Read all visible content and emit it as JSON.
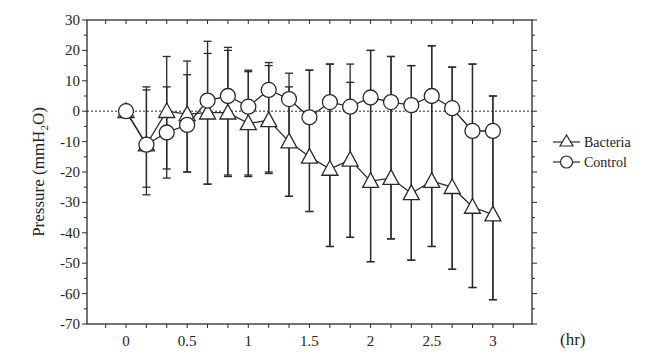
{
  "chart_data": {
    "type": "line",
    "title": "",
    "xlabel": "(hr)",
    "ylabel": "Pressure (mmH2O)",
    "ylabel_parts": {
      "main": "Pressure (mmH",
      "sub": "2",
      "tail": "O)"
    },
    "xlim": [
      -0.33,
      3.33
    ],
    "ylim": [
      -70,
      30
    ],
    "x_ticks": [
      0,
      0.5,
      1,
      1.5,
      2,
      2.5,
      3
    ],
    "x_tick_labels": [
      "0",
      "0.5",
      "1",
      "1.5",
      "2",
      "2.5",
      "3"
    ],
    "y_ticks": [
      30,
      20,
      10,
      0,
      -10,
      -20,
      -30,
      -40,
      -50,
      -60,
      -70
    ],
    "y_tick_labels": [
      "30",
      "20",
      "10",
      "0",
      "-10",
      "-20",
      "-30",
      "-40",
      "-50",
      "-60",
      "-70"
    ],
    "reference_line": {
      "y": 0,
      "style": "dotted"
    },
    "grid": false,
    "legend_position": "right",
    "x": [
      0,
      0.167,
      0.333,
      0.5,
      0.667,
      0.833,
      1,
      1.167,
      1.333,
      1.5,
      1.667,
      1.833,
      2,
      2.167,
      2.333,
      2.5,
      2.667,
      2.833,
      3
    ],
    "series": [
      {
        "name": "Bacteria",
        "marker": "triangle",
        "values": [
          0,
          -11,
          0,
          -1,
          -0.5,
          -0.5,
          -4,
          -3,
          -10,
          -15,
          -19,
          -16,
          -23,
          -22,
          -27,
          -23,
          -25,
          -31.5,
          -34
        ],
        "error_upper": [
          0,
          7,
          8,
          12,
          19,
          20,
          13,
          15,
          8,
          13.5,
          15.5,
          9.5,
          20,
          18,
          15,
          21.5,
          14.5,
          15.5,
          5
        ],
        "error_lower": [
          0,
          -25,
          -19,
          -20,
          -24,
          -21,
          -21,
          -20,
          -28,
          -33,
          -44.5,
          -41.5,
          -49.5,
          -42,
          -49,
          -44.5,
          -52,
          -58,
          -62
        ]
      },
      {
        "name": "Control",
        "marker": "circle",
        "values": [
          0,
          -11,
          -7,
          -4.5,
          3.5,
          5,
          1.5,
          7,
          4,
          -2,
          3,
          1.5,
          4.5,
          3,
          2,
          5,
          1,
          -6.5,
          -6.5
        ],
        "error_upper": [
          0,
          8,
          18,
          16.5,
          23,
          21,
          13.5,
          16,
          12.5,
          13.5,
          15.5,
          15.5,
          20,
          18,
          15,
          21.5,
          14.5,
          15.5,
          5
        ],
        "error_lower": [
          0,
          -27.5,
          -22,
          -20,
          -24,
          -21.5,
          -21.5,
          -20.5,
          -28,
          -33,
          -44.5,
          -41.5,
          -49.5,
          -42,
          -49,
          -44.5,
          -52,
          -58,
          -62
        ]
      }
    ]
  },
  "legend": {
    "items": [
      {
        "label": "Bacteria",
        "marker": "triangle-icon"
      },
      {
        "label": "Control",
        "marker": "circle-icon"
      }
    ]
  },
  "colors": {
    "ink": "#2a2a2a",
    "background": "#ffffff",
    "marker_fill": "#ffffff"
  }
}
